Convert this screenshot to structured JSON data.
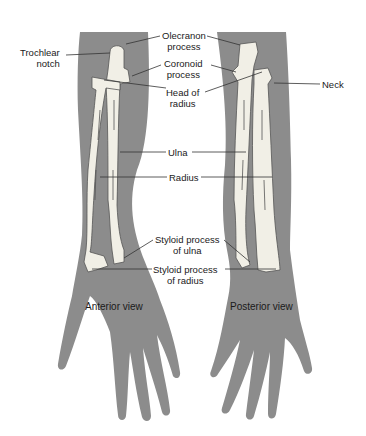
{
  "figure": {
    "colors": {
      "skin": "#8c8c8c",
      "bone": "#f1efe6",
      "bone_edge": "#555555",
      "leader": "#333333"
    },
    "views": [
      {
        "label": "Anterior view"
      },
      {
        "label": "Posterior view"
      }
    ],
    "labels": {
      "trochlear_notch": [
        "Trochlear",
        "notch"
      ],
      "olecranon_process": [
        "Olecranon",
        "process"
      ],
      "coronoid_process": [
        "Coronoid",
        "process"
      ],
      "head_of_radius": [
        "Head of",
        "radius"
      ],
      "neck": "Neck",
      "ulna": "Ulna",
      "radius": "Radius",
      "styloid_ulna": [
        "Styloid process",
        "of ulna"
      ],
      "styloid_radius": [
        "Styloid process",
        "of radius"
      ]
    }
  }
}
